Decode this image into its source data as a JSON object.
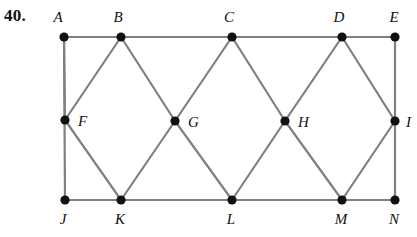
{
  "problem": {
    "number_label": "40."
  },
  "figure": {
    "type": "geometric-diagram",
    "stroke_color": "#808080",
    "vertex_color": "#111111",
    "label_color": "#111111",
    "stroke_width": 2.2,
    "vertex_radius": 4.6,
    "vertices": [
      {
        "id": "A",
        "label": "A",
        "x": 64,
        "y": 37,
        "label_x": 58,
        "label_y": 22,
        "label_anchor": "middle"
      },
      {
        "id": "B",
        "label": "B",
        "x": 121,
        "y": 37,
        "label_x": 118,
        "label_y": 22,
        "label_anchor": "middle"
      },
      {
        "id": "C",
        "label": "C",
        "x": 232,
        "y": 37,
        "label_x": 229,
        "label_y": 22,
        "label_anchor": "middle"
      },
      {
        "id": "D",
        "label": "D",
        "x": 342,
        "y": 37,
        "label_x": 339,
        "label_y": 22,
        "label_anchor": "middle"
      },
      {
        "id": "E",
        "label": "E",
        "x": 395,
        "y": 37,
        "label_x": 394,
        "label_y": 22,
        "label_anchor": "middle"
      },
      {
        "id": "F",
        "label": "F",
        "x": 65,
        "y": 120,
        "label_x": 78,
        "label_y": 126,
        "label_anchor": "start"
      },
      {
        "id": "G",
        "label": "G",
        "x": 175,
        "y": 121,
        "label_x": 188,
        "label_y": 127,
        "label_anchor": "start"
      },
      {
        "id": "H",
        "label": "H",
        "x": 285,
        "y": 121,
        "label_x": 298,
        "label_y": 127,
        "label_anchor": "start"
      },
      {
        "id": "I",
        "label": "I",
        "x": 395,
        "y": 121,
        "label_x": 406,
        "label_y": 127,
        "label_anchor": "start"
      },
      {
        "id": "J",
        "label": "J",
        "x": 65,
        "y": 200,
        "label_x": 63,
        "label_y": 224,
        "label_anchor": "middle"
      },
      {
        "id": "K",
        "label": "K",
        "x": 121,
        "y": 200,
        "label_x": 120,
        "label_y": 224,
        "label_anchor": "middle"
      },
      {
        "id": "L",
        "label": "L",
        "x": 232,
        "y": 200,
        "label_x": 231,
        "label_y": 224,
        "label_anchor": "middle"
      },
      {
        "id": "M",
        "label": "M",
        "x": 342,
        "y": 200,
        "label_x": 341,
        "label_y": 224,
        "label_anchor": "middle"
      },
      {
        "id": "N",
        "label": "N",
        "x": 395,
        "y": 200,
        "label_x": 394,
        "label_y": 224,
        "label_anchor": "middle"
      }
    ],
    "edges": [
      {
        "from": "A",
        "to": "E",
        "name": "edge-top"
      },
      {
        "from": "J",
        "to": "N",
        "name": "edge-bottom"
      },
      {
        "from": "A",
        "to": "J",
        "name": "edge-left"
      },
      {
        "from": "E",
        "to": "N",
        "name": "edge-right"
      },
      {
        "from": "A",
        "to": "F",
        "name": "edge-a-f"
      },
      {
        "from": "B",
        "to": "F",
        "name": "edge-b-f"
      },
      {
        "from": "B",
        "to": "G",
        "name": "edge-b-g"
      },
      {
        "from": "C",
        "to": "G",
        "name": "edge-c-g"
      },
      {
        "from": "C",
        "to": "H",
        "name": "edge-c-h"
      },
      {
        "from": "D",
        "to": "H",
        "name": "edge-d-h"
      },
      {
        "from": "D",
        "to": "I",
        "name": "edge-d-i"
      },
      {
        "from": "F",
        "to": "K",
        "name": "edge-f-k"
      },
      {
        "from": "G",
        "to": "K",
        "name": "edge-g-k"
      },
      {
        "from": "G",
        "to": "L",
        "name": "edge-g-l"
      },
      {
        "from": "H",
        "to": "L",
        "name": "edge-h-l"
      },
      {
        "from": "H",
        "to": "M",
        "name": "edge-h-m"
      },
      {
        "from": "I",
        "to": "M",
        "name": "edge-i-m"
      }
    ]
  }
}
